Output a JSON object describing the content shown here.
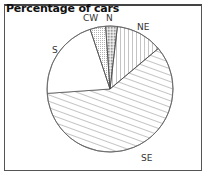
{
  "chart_data": {
    "type": "pie",
    "title": "Percentage of cars",
    "categories": [
      "N",
      "NE",
      "SE",
      "S",
      "CW"
    ],
    "values": [
      3,
      12,
      60,
      21,
      4
    ],
    "patterns": {
      "N": "dense-dots",
      "NE": "vertical-lines",
      "SE": "diagonal-lines",
      "S": "blank",
      "CW": "dots"
    },
    "legend": "labels on slices"
  },
  "labels": {
    "N": "N",
    "NE": "NE",
    "SE": "SE",
    "S": "S",
    "CW": "CW"
  }
}
